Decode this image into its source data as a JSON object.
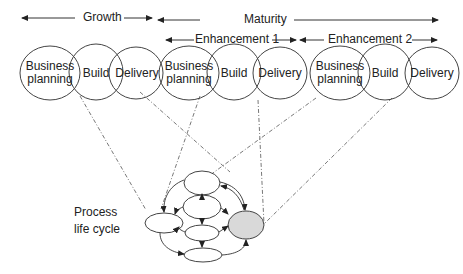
{
  "timeline": {
    "growth": "Growth",
    "maturity": "Maturity",
    "enhancement1": "Enhancement 1",
    "enhancement2": "Enhancement 2"
  },
  "groups": [
    {
      "name": "growth",
      "nodes": [
        "Business planning",
        "Build",
        "Delivery"
      ]
    },
    {
      "name": "enhancement-1",
      "nodes": [
        "Business planning",
        "Build",
        "Delivery"
      ]
    },
    {
      "name": "enhancement-2",
      "nodes": [
        "Business planning",
        "Build",
        "Delivery"
      ]
    }
  ],
  "labels": {
    "business_line1": "Business",
    "business_line2": "planning",
    "build": "Build",
    "delivery": "Delivery",
    "process_line1": "Process",
    "process_line2": "life cycle"
  },
  "colors": {
    "stroke": "#444444",
    "highlight_fill": "#d9d9d9",
    "dashed": "#555555"
  }
}
